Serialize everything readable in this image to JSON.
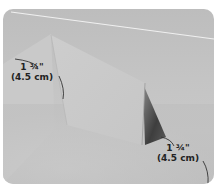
{
  "image": {
    "subject": "folded paper tent standing on a surface",
    "style": "grayscale photograph with rounded corners",
    "colors": {
      "background": "#c4c4c4",
      "paper_front": "#cfcfcf",
      "paper_shadow": "#4a4a4a",
      "accent_line": "#f2f2f2",
      "label_text": "#222222"
    }
  },
  "annotations": {
    "left": {
      "imperial": "1 ¾\"",
      "metric": "(4.5 cm)"
    },
    "right": {
      "imperial": "1 ¾\"",
      "metric": "(4.5 cm)"
    }
  }
}
